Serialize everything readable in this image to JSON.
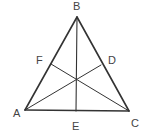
{
  "diagram": {
    "type": "triangle-with-cevians",
    "stroke_color": "#333333",
    "label_color": "#444444",
    "background": "#ffffff",
    "vertices": {
      "A": {
        "x": 25,
        "y": 110,
        "label": "A",
        "label_x": 13,
        "label_y": 117
      },
      "B": {
        "x": 77,
        "y": 17,
        "label": "B",
        "label_x": 73,
        "label_y": 10
      },
      "C": {
        "x": 129,
        "y": 111,
        "label": "C",
        "label_x": 131,
        "label_y": 127
      }
    },
    "points": {
      "D": {
        "x": 101,
        "y": 65,
        "label": "D",
        "label_x": 108,
        "label_y": 64
      },
      "E": {
        "x": 76,
        "y": 111,
        "label": "E",
        "label_x": 72,
        "label_y": 130
      },
      "F": {
        "x": 51,
        "y": 64,
        "label": "F",
        "label_x": 36,
        "label_y": 64
      }
    },
    "segments": [
      {
        "from": "A",
        "to": "B",
        "width": 1.6
      },
      {
        "from": "B",
        "to": "C",
        "width": 1.6
      },
      {
        "from": "A",
        "to": "C",
        "width": 1.6
      },
      {
        "from": "B",
        "to": "E",
        "width": 1.1
      },
      {
        "from": "A",
        "to": "D",
        "width": 1.0
      },
      {
        "from": "C",
        "to": "F",
        "width": 1.0
      }
    ]
  }
}
